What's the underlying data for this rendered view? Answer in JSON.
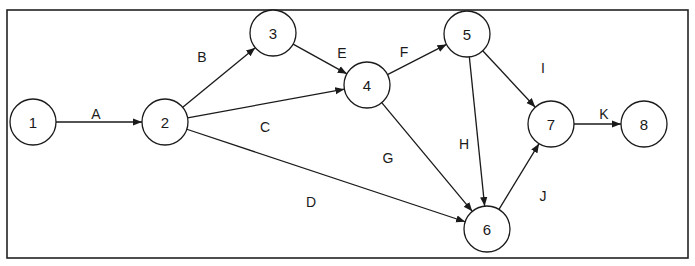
{
  "diagram": {
    "type": "activity-on-arrow network",
    "nodes": [
      {
        "id": "1",
        "label": "1",
        "x": 33,
        "y": 122
      },
      {
        "id": "2",
        "label": "2",
        "x": 165,
        "y": 122
      },
      {
        "id": "3",
        "label": "3",
        "x": 273,
        "y": 33
      },
      {
        "id": "4",
        "label": "4",
        "x": 367,
        "y": 85
      },
      {
        "id": "5",
        "label": "5",
        "x": 467,
        "y": 34
      },
      {
        "id": "6",
        "label": "6",
        "x": 487,
        "y": 229
      },
      {
        "id": "7",
        "label": "7",
        "x": 551,
        "y": 124
      },
      {
        "id": "8",
        "label": "8",
        "x": 644,
        "y": 124
      }
    ],
    "edges": [
      {
        "label": "A",
        "from": "1",
        "to": "2",
        "lx": 96,
        "ly": 114
      },
      {
        "label": "B",
        "from": "2",
        "to": "3",
        "lx": 202,
        "ly": 57
      },
      {
        "label": "C",
        "from": "2",
        "to": "4",
        "lx": 265,
        "ly": 127
      },
      {
        "label": "D",
        "from": "2",
        "to": "6",
        "lx": 311,
        "ly": 202
      },
      {
        "label": "E",
        "from": "3",
        "to": "4",
        "lx": 342,
        "ly": 53
      },
      {
        "label": "F",
        "from": "4",
        "to": "5",
        "lx": 404,
        "ly": 52
      },
      {
        "label": "G",
        "from": "4",
        "to": "6",
        "lx": 388,
        "ly": 158
      },
      {
        "label": "H",
        "from": "5",
        "to": "6",
        "lx": 464,
        "ly": 144
      },
      {
        "label": "I",
        "from": "5",
        "to": "7",
        "lx": 543,
        "ly": 68
      },
      {
        "label": "J",
        "from": "6",
        "to": "7",
        "lx": 543,
        "ly": 196
      },
      {
        "label": "K",
        "from": "7",
        "to": "8",
        "lx": 604,
        "ly": 114
      }
    ],
    "node_radius": 23,
    "colors": {
      "stroke": "#1a1a1a",
      "background": "#ffffff"
    }
  }
}
